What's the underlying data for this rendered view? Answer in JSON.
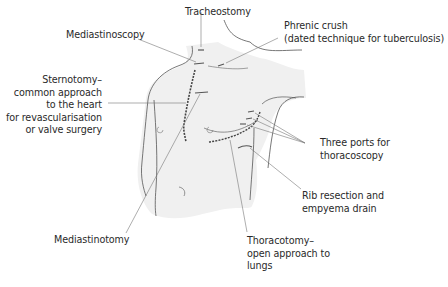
{
  "diagram": {
    "colors": {
      "skin": "#f0f0f0",
      "outline": "#555555",
      "leader": "#777777",
      "text": "#2a2a2a",
      "background": "#ffffff"
    },
    "labels": {
      "tracheostomy": {
        "lines": [
          "Tracheostomy"
        ]
      },
      "mediastinoscopy": {
        "lines": [
          "Mediastinoscopy"
        ]
      },
      "phrenic_crush": {
        "lines": [
          "Phrenic crush",
          "(dated technique for tuberculosis)"
        ]
      },
      "sternotomy": {
        "lines": [
          "Sternotomy–",
          "common approach",
          "to the heart",
          "for revascularisation",
          "or valve surgery"
        ]
      },
      "three_ports": {
        "lines": [
          "Three ports for",
          "thoracoscopy"
        ]
      },
      "rib_resection": {
        "lines": [
          "Rib resection and",
          "empyema drain"
        ]
      },
      "mediastinotomy": {
        "lines": [
          "Mediastinotomy"
        ]
      },
      "thoracotomy": {
        "lines": [
          "Thoracotomy–",
          "open approach to",
          "lungs"
        ]
      }
    }
  }
}
